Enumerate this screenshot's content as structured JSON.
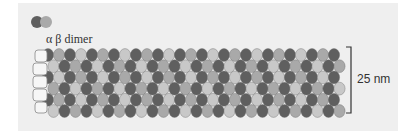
{
  "figure": {
    "dimer_legend": {
      "label": "α β dimer",
      "alpha_color": "#5f5f5f",
      "beta_color": "#a9a9a9"
    },
    "scale": {
      "label": "25 nm"
    },
    "colors": {
      "panel_background": "#efefef",
      "alpha_subunit": "#5f5f5f",
      "beta_subunit": "#a9a9a9",
      "light_subunit": "#c8c8c8",
      "bracket": "#333333"
    }
  }
}
